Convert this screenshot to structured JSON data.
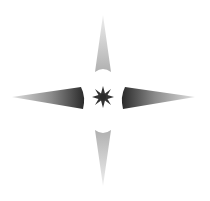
{
  "graphic": {
    "name": "compass-star",
    "background": "#ffffff",
    "arms": {
      "top": {
        "tip_color": "#e6e6e6",
        "base_color": "#b5b5b5"
      },
      "bottom": {
        "tip_color": "#e6e6e6",
        "base_color": "#b5b5b5"
      },
      "left": {
        "tip_color": "#d0d0d0",
        "base_color": "#2e2e2e"
      },
      "right": {
        "tip_color": "#d0d0d0",
        "base_color": "#2e2e2e"
      }
    },
    "center_star": {
      "points": 8,
      "color": "#333333"
    }
  }
}
